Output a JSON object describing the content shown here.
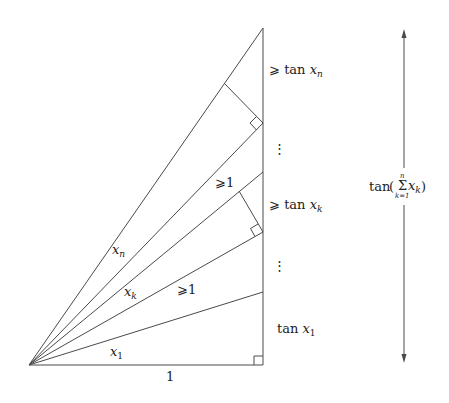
{
  "diagram": {
    "labels": {
      "base": "1",
      "angle_x1": "x",
      "angle_x1_sub": "1",
      "angle_xk": "x",
      "angle_xk_sub": "k",
      "angle_xn": "x",
      "angle_xn_sub": "n",
      "ge1_lower": "⩾1",
      "ge1_upper": "⩾1",
      "tan_x1_prefix": "tan ",
      "tan_x1_var": "x",
      "tan_x1_sub": "1",
      "ge_tan_xk_prefix": "⩾ tan ",
      "ge_tan_xk_var": "x",
      "ge_tan_xk_sub": "k",
      "ge_tan_xn_prefix": "⩾ tan ",
      "ge_tan_xn_var": "x",
      "ge_tan_xn_sub": "n",
      "vdots_upper": "⋮",
      "vdots_lower": "⋮",
      "total_prefix": "tan",
      "total_open": "(",
      "total_sigma": "Σ",
      "total_sigma_top": "n",
      "total_sigma_bottom": "k=1",
      "total_var": "x",
      "total_var_sub": "k",
      "total_close": ")"
    },
    "colors": {
      "line": "#4a4a4a",
      "text": "#222222",
      "background": "#ffffff"
    }
  }
}
